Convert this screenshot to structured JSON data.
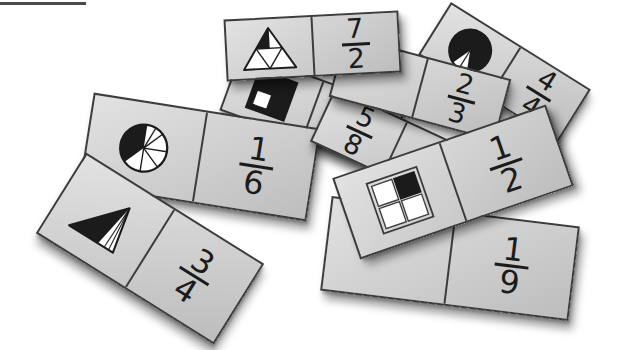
{
  "scene": {
    "title": "fraction dominoes scattered on white background",
    "background": "#ffffff",
    "top_rule_color": "#4a4a4a",
    "card_face": "#cecece",
    "card_border": "#3c3c3c",
    "ink": "#1b1b1b"
  },
  "tiles": [
    {
      "id": "7-2",
      "picture": "triangle-divided-into-quarters-apex-left-shaded",
      "fraction": {
        "numerator": "7",
        "denominator": "2"
      }
    },
    {
      "id": "4-4",
      "picture": "circle-seven-eighths-shaded-black",
      "fraction": {
        "numerator": "4",
        "denominator": "4"
      }
    },
    {
      "id": "square",
      "picture": "square-three-quarters-shaded-black",
      "fraction": null
    },
    {
      "id": "2-3",
      "picture": null,
      "fraction": {
        "numerator": "2",
        "denominator": "3"
      }
    },
    {
      "id": "5-8",
      "picture": null,
      "fraction": {
        "numerator": "5",
        "denominator": "8"
      }
    },
    {
      "id": "1-2",
      "picture": "two-by-two-grid-top-right-square-shaded",
      "fraction": {
        "numerator": "1",
        "denominator": "2"
      }
    },
    {
      "id": "1-6",
      "picture": "circle-eighths-three-shaded-black",
      "fraction": {
        "numerator": "1",
        "denominator": "6"
      }
    },
    {
      "id": "3-4",
      "picture": "triangle-fan-three-quarters-shaded-black",
      "fraction": {
        "numerator": "3",
        "denominator": "4"
      }
    },
    {
      "id": "1-9",
      "picture": null,
      "fraction": {
        "numerator": "1",
        "denominator": "9"
      }
    }
  ]
}
